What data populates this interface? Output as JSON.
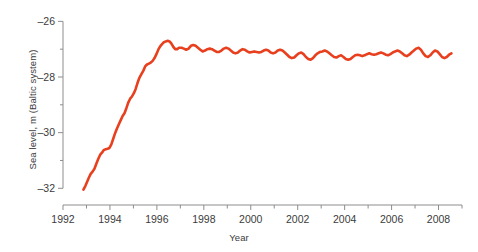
{
  "chart_data": {
    "type": "line",
    "title": "",
    "subtitle": "",
    "xlabel": "Year",
    "ylabel": "Sea level, m (Baltic system)",
    "xlim": [
      1992,
      2009
    ],
    "ylim": [
      -32.6,
      -25.7
    ],
    "xticks": [
      1992,
      1994,
      1996,
      1998,
      2000,
      2002,
      2004,
      2006,
      2008
    ],
    "xtick_labels": [
      "1992",
      "1994",
      "1996",
      "1998",
      "2000",
      "2002",
      "2004",
      "2006",
      "2008"
    ],
    "xminor_ticks": [
      1993,
      1995,
      1997,
      1999,
      2001,
      2003,
      2005,
      2007,
      2009
    ],
    "yticks": [
      -26,
      -28,
      -30,
      -32
    ],
    "ytick_labels": [
      "–26",
      "–28",
      "–30",
      "–32"
    ],
    "yminor_ticks": [
      -27,
      -29,
      -31
    ],
    "grid": false,
    "legend": null,
    "legend_position": "none",
    "series": [
      {
        "name": "Sea level",
        "color": "#e8401f",
        "line_width": 2.6,
        "x": [
          1992.87,
          1992.95,
          1993.02,
          1993.1,
          1993.18,
          1993.26,
          1993.34,
          1993.42,
          1993.5,
          1993.58,
          1993.66,
          1993.74,
          1993.82,
          1993.9,
          1993.98,
          1994.06,
          1994.14,
          1994.22,
          1994.3,
          1994.38,
          1994.46,
          1994.54,
          1994.62,
          1994.7,
          1994.78,
          1994.86,
          1994.94,
          1995.02,
          1995.1,
          1995.18,
          1995.26,
          1995.34,
          1995.42,
          1995.5,
          1995.58,
          1995.66,
          1995.74,
          1995.82,
          1995.9,
          1995.98,
          1996.06,
          1996.14,
          1996.22,
          1996.3,
          1996.38,
          1996.46,
          1996.54,
          1996.62,
          1996.7,
          1996.78,
          1996.86,
          1996.94,
          1997.05,
          1997.15,
          1997.25,
          1997.35,
          1997.45,
          1997.55,
          1997.65,
          1997.75,
          1997.85,
          1997.95,
          1998.05,
          1998.15,
          1998.25,
          1998.35,
          1998.45,
          1998.55,
          1998.65,
          1998.75,
          1998.85,
          1998.95,
          1999.05,
          1999.15,
          1999.25,
          1999.35,
          1999.45,
          1999.55,
          1999.65,
          1999.75,
          1999.85,
          1999.95,
          2000.05,
          2000.15,
          2000.25,
          2000.35,
          2000.45,
          2000.55,
          2000.65,
          2000.75,
          2000.85,
          2000.95,
          2001.05,
          2001.15,
          2001.25,
          2001.35,
          2001.45,
          2001.55,
          2001.65,
          2001.75,
          2001.85,
          2001.95,
          2002.05,
          2002.15,
          2002.25,
          2002.35,
          2002.45,
          2002.55,
          2002.65,
          2002.75,
          2002.85,
          2002.95,
          2003.05,
          2003.15,
          2003.25,
          2003.35,
          2003.45,
          2003.55,
          2003.65,
          2003.75,
          2003.85,
          2003.95,
          2004.05,
          2004.15,
          2004.25,
          2004.35,
          2004.45,
          2004.55,
          2004.65,
          2004.75,
          2004.85,
          2004.95,
          2005.05,
          2005.15,
          2005.25,
          2005.35,
          2005.45,
          2005.55,
          2005.65,
          2005.75,
          2005.85,
          2005.95,
          2006.05,
          2006.15,
          2006.25,
          2006.35,
          2006.45,
          2006.55,
          2006.65,
          2006.75,
          2006.85,
          2006.95,
          2007.05,
          2007.15,
          2007.25,
          2007.35,
          2007.45,
          2007.55,
          2007.65,
          2007.75,
          2007.85,
          2007.95,
          2008.05,
          2008.15,
          2008.25,
          2008.35,
          2008.45,
          2008.55
        ],
        "y": [
          -32.05,
          -31.92,
          -31.78,
          -31.62,
          -31.48,
          -31.4,
          -31.3,
          -31.12,
          -30.95,
          -30.8,
          -30.72,
          -30.62,
          -30.6,
          -30.58,
          -30.55,
          -30.42,
          -30.22,
          -30.02,
          -29.85,
          -29.7,
          -29.55,
          -29.4,
          -29.3,
          -29.12,
          -28.92,
          -28.78,
          -28.7,
          -28.58,
          -28.42,
          -28.2,
          -28.02,
          -27.9,
          -27.78,
          -27.62,
          -27.55,
          -27.52,
          -27.48,
          -27.42,
          -27.32,
          -27.18,
          -27.02,
          -26.9,
          -26.82,
          -26.75,
          -26.72,
          -26.7,
          -26.72,
          -26.8,
          -26.92,
          -27.0,
          -27.0,
          -26.95,
          -26.95,
          -26.98,
          -27.02,
          -26.98,
          -26.88,
          -26.85,
          -26.88,
          -26.95,
          -27.02,
          -27.08,
          -27.05,
          -27.0,
          -26.98,
          -27.0,
          -27.05,
          -27.1,
          -27.1,
          -27.05,
          -26.98,
          -26.95,
          -26.98,
          -27.05,
          -27.12,
          -27.15,
          -27.12,
          -27.05,
          -27.0,
          -27.02,
          -27.08,
          -27.12,
          -27.1,
          -27.08,
          -27.1,
          -27.12,
          -27.1,
          -27.05,
          -27.02,
          -27.05,
          -27.12,
          -27.15,
          -27.12,
          -27.05,
          -27.02,
          -27.05,
          -27.12,
          -27.2,
          -27.28,
          -27.32,
          -27.3,
          -27.22,
          -27.15,
          -27.12,
          -27.18,
          -27.28,
          -27.35,
          -27.38,
          -27.32,
          -27.22,
          -27.15,
          -27.1,
          -27.08,
          -27.05,
          -27.08,
          -27.15,
          -27.22,
          -27.28,
          -27.3,
          -27.25,
          -27.22,
          -27.28,
          -27.35,
          -27.38,
          -27.35,
          -27.28,
          -27.22,
          -27.2,
          -27.22,
          -27.25,
          -27.22,
          -27.18,
          -27.15,
          -27.18,
          -27.2,
          -27.18,
          -27.15,
          -27.12,
          -27.15,
          -27.2,
          -27.22,
          -27.18,
          -27.12,
          -27.08,
          -27.05,
          -27.08,
          -27.15,
          -27.22,
          -27.25,
          -27.2,
          -27.12,
          -27.05,
          -26.98,
          -26.95,
          -27.02,
          -27.15,
          -27.25,
          -27.28,
          -27.22,
          -27.12,
          -27.05,
          -27.08,
          -27.18,
          -27.28,
          -27.32,
          -27.28,
          -27.2,
          -27.15
        ]
      }
    ]
  },
  "axes": {
    "y_title": "Sea level, m (Baltic system)",
    "x_title": "Year"
  }
}
